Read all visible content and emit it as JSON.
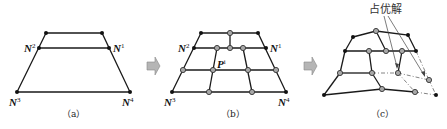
{
  "panels": [
    {
      "id": "a",
      "caption": "（a）",
      "labels": {
        "n1": "N",
        "n1_sup": "1",
        "n2": "N",
        "n2_sup": "2",
        "n3": "N",
        "n3_sup": "3",
        "n4": "N",
        "n4_sup": "4"
      }
    },
    {
      "id": "b",
      "caption": "（b）",
      "labels": {
        "n1": "N",
        "n1_sup": "1",
        "n2": "N",
        "n2_sup": "2",
        "n3": "N",
        "n3_sup": "3",
        "n4": "N",
        "n4_sup": "4",
        "p": "P",
        "p_sup": "i"
      }
    },
    {
      "id": "c",
      "caption": "（c）",
      "annotation": "占优解"
    }
  ],
  "colors": {
    "edge": "#1a1a1a",
    "node_fill": "#a8a8a8",
    "arrow_fill": "#b5b5b5"
  }
}
